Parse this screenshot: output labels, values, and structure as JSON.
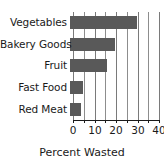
{
  "chart_data": {
    "type": "bar",
    "orientation": "horizontal",
    "title": "",
    "xlabel": "Percent Wasted",
    "ylabel": "",
    "categories": [
      "Vegetables",
      "Bakery Goods",
      "Fruit",
      "Fast Food",
      "Red Meat"
    ],
    "values": [
      31,
      21,
      17,
      6,
      5
    ],
    "series": [
      {
        "name": "Percent Wasted",
        "values": [
          31,
          21,
          17,
          6,
          5
        ]
      }
    ],
    "xlim": [
      0,
      40
    ],
    "ylim": [
      0,
      5
    ],
    "xticks": [
      0,
      5,
      10,
      15,
      20,
      25,
      30,
      35,
      40
    ],
    "xtick_labels": [
      "0",
      "",
      "10",
      "",
      "20",
      "",
      "30",
      "",
      "40"
    ],
    "labeled_xticks": [
      0,
      10,
      20,
      30,
      40
    ],
    "labeled_xtick_text": [
      "0",
      "10",
      "20",
      "30",
      "40"
    ],
    "grid": true,
    "grid_axis": "x",
    "legend": false,
    "legend_position": "none",
    "annotations": [],
    "colors": {
      "bar_fill": "#595959",
      "gridline": "#8d8d8d",
      "axis": "#1a1a1a",
      "text": "#1a1a1a",
      "background": "#ffffff"
    }
  },
  "axis": {
    "x_title": "Percent Wasted"
  }
}
